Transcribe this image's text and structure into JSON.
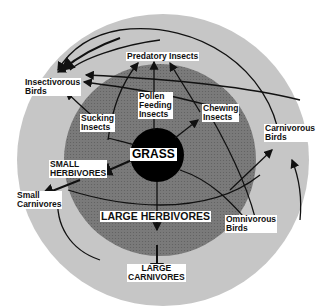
{
  "diagram": {
    "colors": {
      "outer_ring": "#c4c4c4",
      "inner_disc": "#7a7a7a",
      "core": "#000000",
      "arrows": "#111111",
      "label_bg": "#ffffff"
    },
    "center": {
      "label": "GRASS"
    },
    "nodes": {
      "predatory_insects": "Predatory Insects",
      "insectivorous_birds_1": "Insectivorous",
      "insectivorous_birds_2": "Birds",
      "pollen_feeding_1": "Pollen",
      "pollen_feeding_2": "Feeding",
      "pollen_feeding_3": "Insects",
      "sucking_insects_1": "Sucking",
      "sucking_insects_2": "Insects",
      "chewing_insects_1": "Chewing",
      "chewing_insects_2": "Insects",
      "carnivorous_birds_1": "Carnivorous",
      "carnivorous_birds_2": "Birds",
      "small_herbivores_1": "SMALL",
      "small_herbivores_2": "HERBIVORES",
      "small_carnivores_1": "Small",
      "small_carnivores_2": "Carnivores",
      "large_herbivores": "LARGE HERBIVORES",
      "omnivorous_birds_1": "Omnivorous",
      "omnivorous_birds_2": "Birds",
      "large_carnivores_1": "LARGE",
      "large_carnivores_2": "CARNIVORES"
    }
  }
}
